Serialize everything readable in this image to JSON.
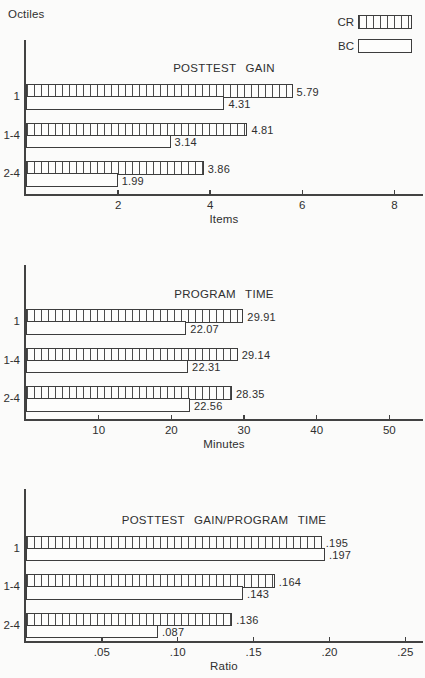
{
  "page": {
    "octiles_label": "Octiles"
  },
  "colors": {
    "line": "#3d3d3d",
    "text": "#2f2f2f",
    "background": "#fbfbfa",
    "bar_fill": "#fdfdfc"
  },
  "legend": {
    "items": [
      {
        "label": "CR",
        "pattern": "hatched"
      },
      {
        "label": "BC",
        "pattern": "plain"
      }
    ]
  },
  "chart_data": [
    {
      "type": "bar",
      "orientation": "horizontal",
      "title": "POSTTEST GAIN",
      "xlabel": "Items",
      "ylabel": "Octiles",
      "categories": [
        "1",
        "1-4",
        "2-4"
      ],
      "series": [
        {
          "name": "CR",
          "pattern": "hatched",
          "values": [
            5.79,
            4.81,
            3.86
          ],
          "labels": [
            "5.79",
            "4.81",
            "3.86"
          ]
        },
        {
          "name": "BC",
          "pattern": "plain",
          "values": [
            4.31,
            3.14,
            1.99
          ],
          "labels": [
            "4.31",
            "3.14",
            "1.99"
          ]
        }
      ],
      "xticks": [
        2,
        4,
        6,
        8
      ],
      "xtick_labels": [
        "2",
        "4",
        "6",
        "8"
      ],
      "xlim": [
        0,
        8.6
      ],
      "grid": false,
      "legend_position": "top-right"
    },
    {
      "type": "bar",
      "orientation": "horizontal",
      "title": "PROGRAM TIME",
      "xlabel": "Minutes",
      "ylabel": "Octiles",
      "categories": [
        "1",
        "1-4",
        "2-4"
      ],
      "series": [
        {
          "name": "CR",
          "pattern": "hatched",
          "values": [
            29.91,
            29.14,
            28.35
          ],
          "labels": [
            "29.91",
            "29.14",
            "28.35"
          ]
        },
        {
          "name": "BC",
          "pattern": "plain",
          "values": [
            22.07,
            22.31,
            22.56
          ],
          "labels": [
            "22.07",
            "22.31",
            "22.56"
          ]
        }
      ],
      "xticks": [
        10,
        20,
        30,
        40,
        50
      ],
      "xtick_labels": [
        "10",
        "20",
        "30",
        "40",
        "50"
      ],
      "xlim": [
        0,
        54.5
      ],
      "grid": false
    },
    {
      "type": "bar",
      "orientation": "horizontal",
      "title": "POSTTEST GAIN/PROGRAM TIME",
      "xlabel": "Ratio",
      "ylabel": "Octiles",
      "categories": [
        "1",
        "1-4",
        "2-4"
      ],
      "series": [
        {
          "name": "CR",
          "pattern": "hatched",
          "values": [
            0.195,
            0.164,
            0.136
          ],
          "labels": [
            ".195",
            ".164",
            ".136"
          ]
        },
        {
          "name": "BC",
          "pattern": "plain",
          "values": [
            0.197,
            0.143,
            0.087
          ],
          "labels": [
            ".197",
            ".143",
            ".087"
          ]
        }
      ],
      "xticks": [
        0.05,
        0.1,
        0.15,
        0.2,
        0.25
      ],
      "xtick_labels": [
        ".05",
        ".10",
        ".15",
        ".20",
        ".25"
      ],
      "xlim": [
        0,
        0.261
      ],
      "grid": false
    }
  ]
}
